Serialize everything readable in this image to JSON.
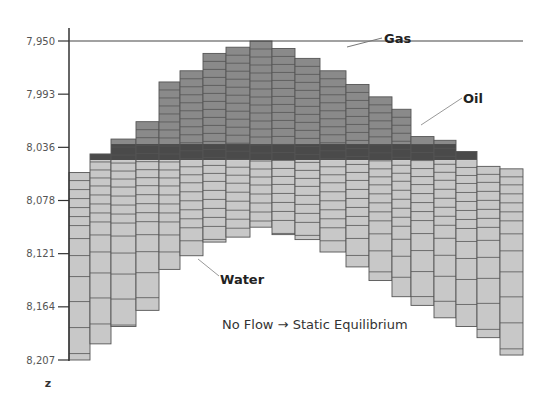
{
  "caption": "No Flow → Static Equilibrium",
  "axis": {
    "label": "z",
    "ticks": [
      "7,950",
      "7,993",
      "8,036",
      "8,078",
      "8,121",
      "8,164",
      "8,207"
    ]
  },
  "labels": {
    "gas": "Gas",
    "oil": "Oil",
    "water": "Water"
  },
  "colors": {
    "gas": "#8a8a8a",
    "oil": "#4a4a4a",
    "water": "#c8c8c8",
    "cell_border": "#555555"
  },
  "layers": {
    "oil_top_depth": 8033,
    "oil_bottom_depth": 8046
  },
  "columns": [
    {
      "top": 8056,
      "bottom": 8207
    },
    {
      "top": 8041,
      "bottom": 8194
    },
    {
      "top": 8029,
      "bottom": 8180
    },
    {
      "top": 8015,
      "bottom": 8167
    },
    {
      "top": 7983,
      "bottom": 8134
    },
    {
      "top": 7974,
      "bottom": 8123
    },
    {
      "top": 7960,
      "bottom": 8112
    },
    {
      "top": 7955,
      "bottom": 8108
    },
    {
      "top": 7950,
      "bottom": 8100
    },
    {
      "top": 7956,
      "bottom": 8106
    },
    {
      "top": 7964,
      "bottom": 8110
    },
    {
      "top": 7974,
      "bottom": 8120
    },
    {
      "top": 7985,
      "bottom": 8132
    },
    {
      "top": 7995,
      "bottom": 8143
    },
    {
      "top": 8005,
      "bottom": 8156
    },
    {
      "top": 8027,
      "bottom": 8163
    },
    {
      "top": 8030,
      "bottom": 8173
    },
    {
      "top": 8039,
      "bottom": 8180
    },
    {
      "top": 8051,
      "bottom": 8189
    },
    {
      "top": 8053,
      "bottom": 8203
    }
  ]
}
